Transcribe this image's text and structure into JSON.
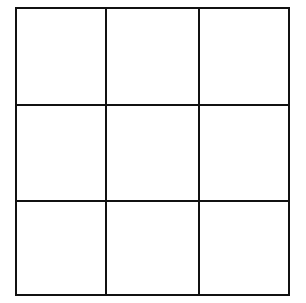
{
  "grid": {
    "rows": 3,
    "columns": 3,
    "line_color": "#111111",
    "background": "#ffffff",
    "cells": [
      [
        "",
        "",
        ""
      ],
      [
        "",
        "",
        ""
      ],
      [
        "",
        "",
        ""
      ]
    ]
  }
}
